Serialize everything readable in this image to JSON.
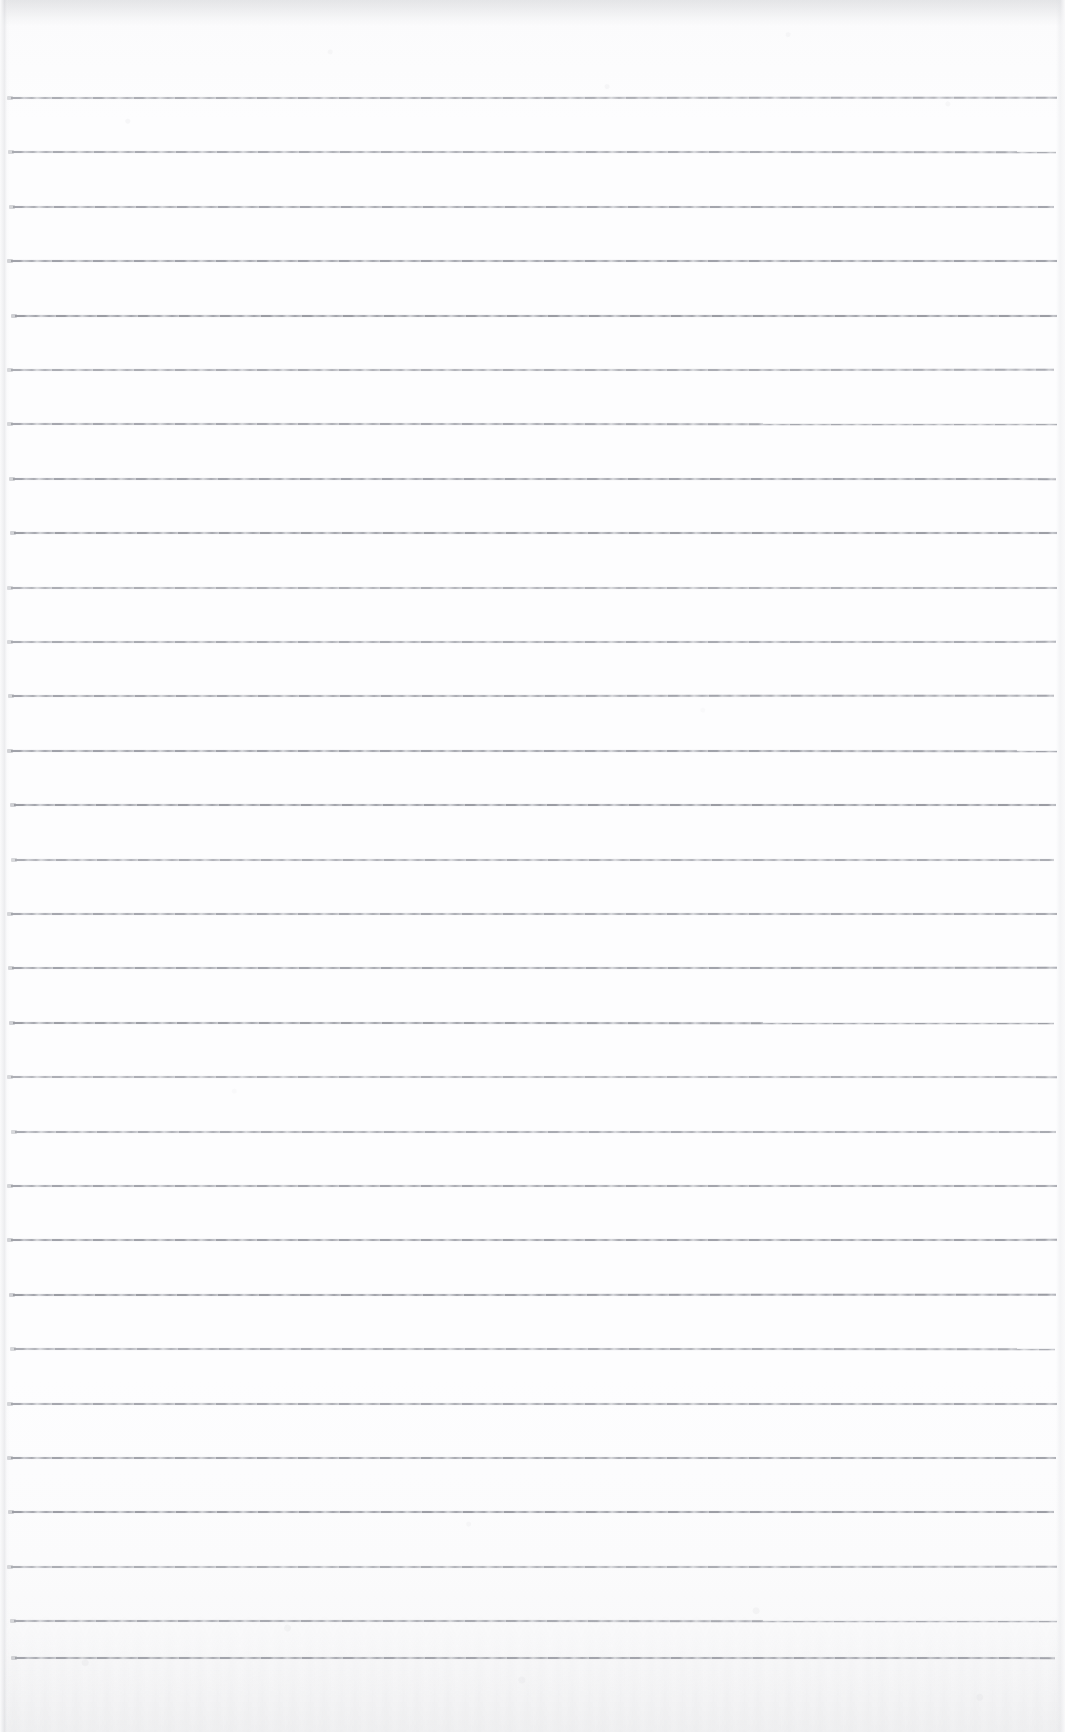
{
  "document": {
    "kind": "scanned-blank-ruled-notebook-page",
    "title": "Blank Ruled Notebook Page",
    "written_content": "",
    "page_width_px": 1065,
    "page_height_px": 1732,
    "background_color": "#fdfdfe",
    "paper_tint_top": "#f6f6f7",
    "paper_tint_bottom": "#f4f4f5"
  },
  "ruling": {
    "line_color": "#92949c",
    "line_color_faded": "#babcc2",
    "line_thickness_px": 2,
    "line_count": 30,
    "first_line_y": 97,
    "line_spacing_px": 54.4,
    "line_start_x": 11,
    "line_end_x": 1057,
    "style": "single-ruled-horizontal",
    "margin_rule": "none",
    "line_y_positions": [
      97,
      151,
      206,
      260,
      315,
      369,
      423,
      478,
      532,
      587,
      641,
      695,
      750,
      804,
      859,
      913,
      967,
      1022,
      1076,
      1131,
      1185,
      1239,
      1294,
      1348,
      1403,
      1457,
      1511,
      1566,
      1620,
      1657
    ]
  },
  "artifacts": {
    "top_shadow_band": "present",
    "left_page_edge": "present",
    "right_page_edge": "present",
    "bottom_grain": "present",
    "scan_speckle": "present"
  }
}
